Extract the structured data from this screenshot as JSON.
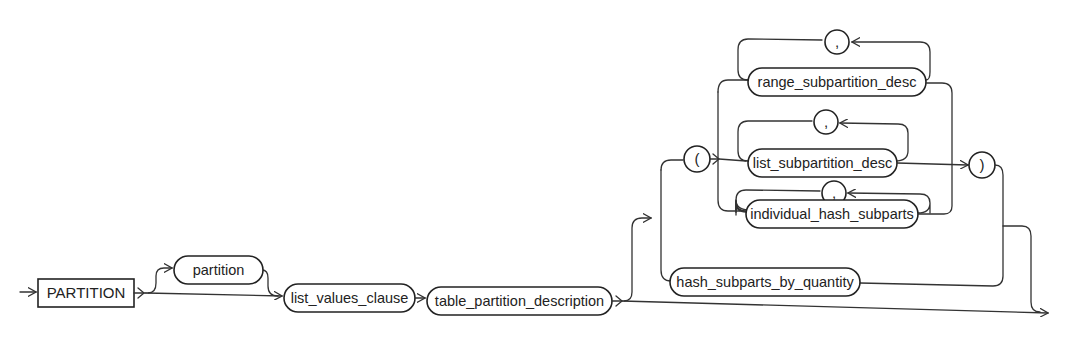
{
  "diagram": {
    "type": "railroad-syntax-diagram",
    "keyword": "PARTITION",
    "nodes": {
      "partition": "partition",
      "list_values_clause": "list_values_clause",
      "table_partition_description": "table_partition_description",
      "open_paren": "(",
      "close_paren": ")",
      "range_subpartition_desc": "range_subpartition_desc",
      "range_comma": ",",
      "list_subpartition_desc": "list_subpartition_desc",
      "list_comma": ",",
      "individual_hash_subparts": "individual_hash_subparts",
      "hash_comma": ",",
      "hash_subparts_by_quantity": "hash_subparts_by_quantity"
    },
    "colors": {
      "line": "#333333",
      "background": "#ffffff"
    }
  }
}
